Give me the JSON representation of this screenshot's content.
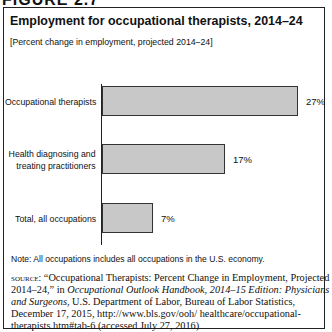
{
  "figure": {
    "label": "FIGURE 2.7"
  },
  "chart_data": {
    "type": "bar",
    "orientation": "horizontal",
    "title": "Employment for occupational therapists, 2014–24",
    "subtitle": "[Percent change in employment, projected 2014–24]",
    "categories": [
      "Occupational therapists",
      "Health diagnosing and treating practitioners",
      "Total, all occupations"
    ],
    "values": [
      27,
      17,
      7
    ],
    "value_labels": [
      "27%",
      "17%",
      "7%"
    ],
    "xlabel": "",
    "ylabel": "",
    "xlim": [
      0,
      30
    ],
    "grid": false,
    "legend": null,
    "bar_color": "#c8c8c8"
  },
  "labels": {
    "cat0": "Occupational therapists",
    "cat1a": "Health diagnosing and",
    "cat1b": "treating practitioners",
    "cat2": "Total, all occupations"
  },
  "note": "Note: All occupations includes all occupations in the U.S. economy.",
  "source": {
    "label": "source:",
    "text1": " “Occupational Therapists: Percent Change in Employment, Projected 2014–24,” in ",
    "italic": "Occupational Outlook Handbook, 2014–15 Edition: Physicians and Surgeons",
    "text2": ", U.S. Department of Labor, Bureau of Labor Statistics, December 17, 2015, http://www.bls.gov/ooh/ healthcare/occupational-therapists.htm#tab-6 (accessed July 27, 2016)"
  }
}
